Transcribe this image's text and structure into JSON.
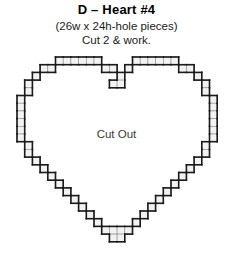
{
  "header": {
    "title": "D – Heart #4",
    "subtitle_1": "(26w x 24h-hole pieces)",
    "subtitle_2": "Cut 2 & work."
  },
  "pattern": {
    "cutout_label": "Cut Out",
    "grid": {
      "columns": 26,
      "rows": 24,
      "cell_px": 7.7,
      "origin_x": 17,
      "origin_y": 7
    },
    "colors": {
      "cell_fill": "#f2f2f2",
      "cell_stroke": "#8c8c8c",
      "outline_stroke": "#1a1a1a",
      "background": "#ffffff",
      "label_text": "#3a3a3a"
    },
    "shape": "heart-outline",
    "cells": [
      [
        5,
        0
      ],
      [
        6,
        0
      ],
      [
        7,
        0
      ],
      [
        8,
        0
      ],
      [
        9,
        0
      ],
      [
        10,
        0
      ],
      [
        15,
        0
      ],
      [
        16,
        0
      ],
      [
        17,
        0
      ],
      [
        18,
        0
      ],
      [
        19,
        0
      ],
      [
        20,
        0
      ],
      [
        3,
        1
      ],
      [
        4,
        1
      ],
      [
        11,
        1
      ],
      [
        12,
        1
      ],
      [
        14,
        1
      ],
      [
        21,
        1
      ],
      [
        22,
        1
      ],
      [
        2,
        2
      ],
      [
        13,
        2
      ],
      [
        23,
        2
      ],
      [
        1,
        3
      ],
      [
        12,
        3
      ],
      [
        13,
        3
      ],
      [
        24,
        3
      ],
      [
        1,
        4
      ],
      [
        24,
        4
      ],
      [
        0,
        5
      ],
      [
        25,
        5
      ],
      [
        0,
        6
      ],
      [
        25,
        6
      ],
      [
        0,
        7
      ],
      [
        25,
        7
      ],
      [
        0,
        8
      ],
      [
        25,
        8
      ],
      [
        0,
        9
      ],
      [
        25,
        9
      ],
      [
        0,
        10
      ],
      [
        25,
        10
      ],
      [
        1,
        11
      ],
      [
        24,
        11
      ],
      [
        1,
        12
      ],
      [
        24,
        12
      ],
      [
        2,
        13
      ],
      [
        23,
        13
      ],
      [
        3,
        14
      ],
      [
        22,
        14
      ],
      [
        4,
        15
      ],
      [
        21,
        15
      ],
      [
        5,
        16
      ],
      [
        20,
        16
      ],
      [
        6,
        17
      ],
      [
        19,
        17
      ],
      [
        7,
        18
      ],
      [
        18,
        18
      ],
      [
        8,
        19
      ],
      [
        17,
        19
      ],
      [
        9,
        20
      ],
      [
        16,
        20
      ],
      [
        10,
        21
      ],
      [
        15,
        21
      ],
      [
        11,
        22
      ],
      [
        12,
        22
      ],
      [
        13,
        22
      ],
      [
        14,
        22
      ],
      [
        12,
        23
      ],
      [
        13,
        23
      ]
    ]
  }
}
